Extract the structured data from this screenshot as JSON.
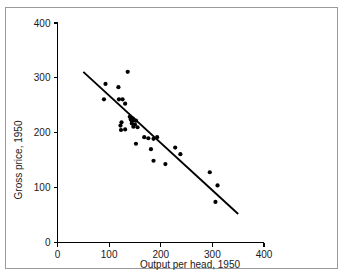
{
  "figure": {
    "frame_border_color": "#9a9a9a",
    "background_color": "#ffffff",
    "point_color": "#000000",
    "line_color": "#000000"
  },
  "axes": {
    "x": {
      "title": "Output per head, 1950",
      "ticks": [
        0,
        100,
        200,
        300,
        400
      ],
      "tick_labels": [
        "0",
        "100",
        "200",
        "300",
        "400"
      ],
      "min": 0,
      "max": 400
    },
    "y": {
      "title": "Gross price, 1950",
      "ticks": [
        0,
        100,
        200,
        300,
        400
      ],
      "tick_labels": [
        "0",
        "100",
        "200",
        "300",
        "400"
      ],
      "min": 0,
      "max": 400
    }
  },
  "chart_data": {
    "type": "scatter",
    "title": "",
    "xlabel": "Output per head, 1950",
    "ylabel": "Gross price, 1950",
    "xlim": [
      0,
      400
    ],
    "ylim": [
      0,
      400
    ],
    "xticks": [
      0,
      100,
      200,
      300,
      400
    ],
    "yticks": [
      0,
      100,
      200,
      300,
      400
    ],
    "grid": false,
    "legend": "none",
    "points": [
      [
        93,
        289
      ],
      [
        90,
        261
      ],
      [
        118,
        283
      ],
      [
        119,
        261
      ],
      [
        126,
        261
      ],
      [
        131,
        253
      ],
      [
        136,
        311
      ],
      [
        124,
        219
      ],
      [
        122,
        213
      ],
      [
        123,
        205
      ],
      [
        131,
        206
      ],
      [
        140,
        229
      ],
      [
        142,
        224
      ],
      [
        144,
        222
      ],
      [
        146,
        226
      ],
      [
        148,
        223
      ],
      [
        150,
        215
      ],
      [
        147,
        211
      ],
      [
        144,
        217
      ],
      [
        152,
        222
      ],
      [
        155,
        210
      ],
      [
        152,
        180
      ],
      [
        168,
        192
      ],
      [
        176,
        190
      ],
      [
        186,
        189
      ],
      [
        193,
        192
      ],
      [
        181,
        170
      ],
      [
        186,
        149
      ],
      [
        209,
        143
      ],
      [
        228,
        173
      ],
      [
        238,
        161
      ],
      [
        295,
        128
      ],
      [
        310,
        104
      ],
      [
        306,
        74
      ]
    ],
    "trend_line": {
      "type": "line",
      "x": [
        50,
        350
      ],
      "y": [
        311,
        52
      ]
    }
  }
}
